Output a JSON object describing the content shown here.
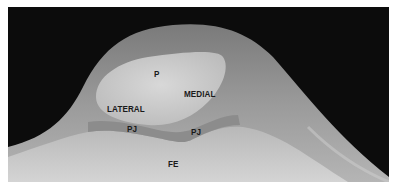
{
  "figure": {
    "type": "radiograph",
    "view": "skyline knee",
    "labels": {
      "patella": "P",
      "medial": "MEDIAL",
      "lateral": "LATERAL",
      "pj_left": "PJ",
      "pj_right": "PJ",
      "femur": "FE"
    },
    "colors": {
      "background": "#0c0c0c",
      "soft_tissue": "#8a8a8a",
      "bone": "#c8c8c8",
      "label_text": "#1a1a1a"
    }
  }
}
